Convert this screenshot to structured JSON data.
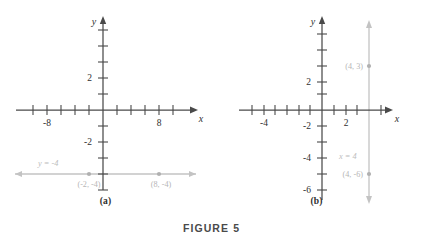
{
  "figure": {
    "caption": "FIGURE 5",
    "panels": [
      {
        "id": "a",
        "sublabel": "(a)",
        "axis": {
          "x_name": "x",
          "y_name": "y",
          "x_ticks_labeled": [
            {
              "value": -8,
              "label": "-8"
            },
            {
              "value": 8,
              "label": "8"
            }
          ],
          "y_ticks_labeled": [
            {
              "value": 2,
              "label": "2"
            },
            {
              "value": -2,
              "label": "-2"
            }
          ],
          "x_tick_values": [
            -10,
            -8,
            -6,
            -4,
            -2,
            2,
            4,
            6,
            8,
            10
          ],
          "y_tick_values": [
            6,
            5,
            4,
            3,
            2,
            1,
            -1,
            -2,
            -3,
            -4,
            -5,
            -6
          ],
          "x_range": [
            -11.5,
            11.5
          ],
          "y_range": [
            -7.0,
            7.0
          ]
        },
        "graph": {
          "orientation": "horizontal",
          "equation_label": "y = -4",
          "y_value": -4,
          "points": [
            {
              "label": "(-2, -4)",
              "x": -2,
              "y": -4
            },
            {
              "label": "(8, -4)",
              "x": 8,
              "y": -4
            }
          ]
        }
      },
      {
        "id": "b",
        "sublabel": "(b)",
        "axis": {
          "x_name": "x",
          "y_name": "y",
          "x_ticks_labeled": [
            {
              "value": -4,
              "label": "-4"
            },
            {
              "value": 2,
              "label": "2"
            }
          ],
          "y_ticks_labeled": [
            {
              "value": 2,
              "label": "2"
            },
            {
              "value": -2,
              "label": "-2"
            },
            {
              "value": -4,
              "label": "-4"
            },
            {
              "value": -6,
              "label": "-6"
            }
          ],
          "x_tick_values": [
            -6,
            -5,
            -4,
            -3,
            -2,
            -1,
            1,
            2,
            3,
            4,
            5
          ],
          "y_tick_values": [
            4,
            3,
            2,
            1,
            -1,
            -2,
            -3,
            -4,
            -5,
            -6
          ],
          "x_range": [
            -7.0,
            6.5
          ],
          "y_range": [
            -7.5,
            5.2
          ]
        },
        "graph": {
          "orientation": "vertical",
          "equation_label": "x = 4",
          "x_value": 4,
          "points": [
            {
              "label": "(4, 3)",
              "x": 4,
              "y": 3
            },
            {
              "label": "(4, -6)",
              "x": 4,
              "y": -6
            }
          ]
        }
      }
    ]
  },
  "colors": {
    "axis": "#4a4a4a",
    "graph_line": "#c3c3c3",
    "point_marker": "#b0b0b0",
    "annotation_text": "#bdbdbd",
    "background": "#ffffff"
  }
}
